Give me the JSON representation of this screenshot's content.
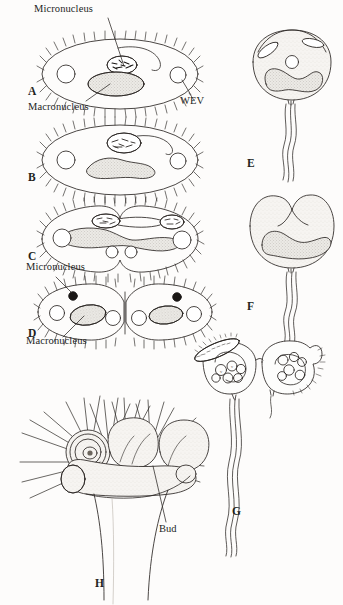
{
  "figure": {
    "domain_note": "scanned textbook line drawing of ciliate protozoan reproduction",
    "background_color": "#fdfcfb",
    "ink_color": "#231f1d",
    "stipple_fill": "#dedad4",
    "panels": [
      {
        "id": "A",
        "x": 28,
        "y": 86,
        "label": "A",
        "caption": "ciliate with macronucleus, micronucleus and water expulsion vesicles"
      },
      {
        "id": "B",
        "x": 28,
        "y": 172,
        "label": "B",
        "caption": "nuclei beginning division"
      },
      {
        "id": "C",
        "x": 28,
        "y": 251,
        "label": "C",
        "caption": "nuclei elongated, cell constricting"
      },
      {
        "id": "D",
        "x": 28,
        "y": 328,
        "label": "D",
        "caption": "two daughter cells separating"
      },
      {
        "id": "E",
        "x": 247,
        "y": 158,
        "label": "E",
        "caption": "stalked peritrich ciliate"
      },
      {
        "id": "F",
        "x": 247,
        "y": 301,
        "label": "F",
        "caption": "stalked ciliate dividing longitudinally"
      },
      {
        "id": "G",
        "x": 232,
        "y": 506,
        "label": "G",
        "caption": "two conjugating stalked ciliates"
      },
      {
        "id": "H",
        "x": 95,
        "y": 578,
        "label": "H",
        "caption": "suctorian producing buds"
      }
    ],
    "annotations": [
      {
        "id": "micronucleus-top",
        "text": "Micronucleus",
        "x": 34,
        "y": 6,
        "leader_from": [
          108,
          18
        ],
        "leader_to": [
          124,
          68
        ]
      },
      {
        "id": "macronucleus-a",
        "text": "Macronucleus",
        "x": 30,
        "y": 105,
        "leader_from": [
          86,
          104
        ],
        "leader_to": [
          112,
          82
        ]
      },
      {
        "id": "wev-a",
        "text": "WEV",
        "x": 182,
        "y": 99,
        "leader_from": [
          191,
          97
        ],
        "leader_to": [
          186,
          78
        ]
      },
      {
        "id": "micronucleus-d",
        "text": "Micronucleus",
        "x": 28,
        "y": 266,
        "leader_from": [
          56,
          278
        ],
        "leader_to": [
          73,
          294
        ]
      },
      {
        "id": "macronucleus-d",
        "text": "Macronucleus",
        "x": 28,
        "y": 340,
        "leader_from": [
          62,
          338
        ],
        "leader_to": [
          83,
          315
        ]
      },
      {
        "id": "bud-h",
        "text": "Bud",
        "x": 160,
        "y": 526,
        "leader_from": [
          166,
          524
        ],
        "leader_to": [
          152,
          466
        ]
      }
    ]
  }
}
